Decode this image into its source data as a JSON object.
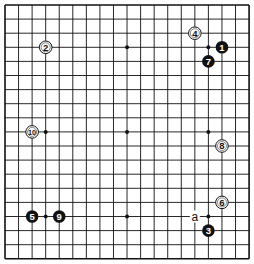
{
  "board": {
    "size": 19,
    "origin_x": 5,
    "origin_y": 5,
    "spacing_x": 13.56,
    "spacing_y": 14.1,
    "line_color": "#111111",
    "background": "#ffffff",
    "hoshi": [
      [
        3,
        3
      ],
      [
        9,
        3
      ],
      [
        15,
        3
      ],
      [
        3,
        9
      ],
      [
        9,
        9
      ],
      [
        15,
        9
      ],
      [
        3,
        15
      ],
      [
        9,
        15
      ],
      [
        15,
        15
      ]
    ]
  },
  "stones": [
    {
      "move": "1",
      "color": "black",
      "col": 16,
      "row": 3
    },
    {
      "move": "2",
      "color": "white",
      "col": 3,
      "row": 3
    },
    {
      "move": "3",
      "color": "black",
      "col": 15,
      "row": 16
    },
    {
      "move": "4",
      "color": "white",
      "col": 14,
      "row": 2
    },
    {
      "move": "5",
      "color": "black",
      "col": 2,
      "row": 15
    },
    {
      "move": "6",
      "color": "white",
      "col": 16,
      "row": 14
    },
    {
      "move": "7",
      "color": "black",
      "col": 15,
      "row": 4
    },
    {
      "move": "8",
      "color": "white",
      "col": 16,
      "row": 10
    },
    {
      "move": "9",
      "color": "black",
      "col": 4,
      "row": 15
    },
    {
      "move": "10",
      "color": "white",
      "col": 2,
      "row": 9
    }
  ],
  "labels": [
    {
      "text": "a",
      "col": 14,
      "row": 15
    }
  ]
}
